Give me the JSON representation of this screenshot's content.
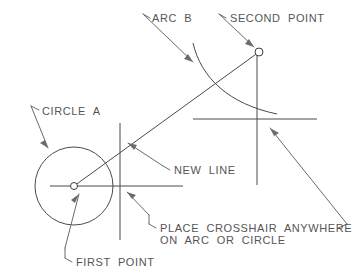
{
  "diagram": {
    "stroke_color": "#4a4a4a",
    "text_color": "#555555",
    "background_color": "#ffffff",
    "labels": {
      "arc_b": "ARC  B",
      "second_point": "SECOND  POINT",
      "circle_a": "CIRCLE  A",
      "new_line": "NEW  LINE",
      "place_crosshair_line1": "PLACE  CROSSHAIR  ANYWHERE",
      "place_crosshair_line2": "ON  ARC  OR  CIRCLE",
      "first_point": "FIRST  POINT"
    },
    "geometry": {
      "circle_a": {
        "cx": 74,
        "cy": 186,
        "r": 39
      },
      "first_point": {
        "cx": 74,
        "cy": 186,
        "r": 3.5
      },
      "second_point": {
        "cx": 259,
        "cy": 52,
        "r": 4
      },
      "new_line": {
        "x1": 74,
        "y1": 186,
        "x2": 259,
        "y2": 52
      },
      "arc_b": {
        "start_x": 193,
        "start_y": 43,
        "end_x": 277,
        "end_y": 114
      },
      "left_crosshair": {
        "vertical_x": 120,
        "vertical_y1": 123,
        "vertical_y2": 240,
        "horizontal_y": 186,
        "horizontal_x1": 50,
        "horizontal_x2": 183
      },
      "right_crosshair": {
        "vertical_x": 257,
        "vertical_y1": 54,
        "vertical_y2": 185,
        "horizontal_y": 119,
        "horizontal_x1": 193,
        "horizontal_x2": 317
      }
    }
  }
}
